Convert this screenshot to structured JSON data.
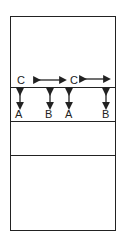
{
  "diagram": {
    "labels_top": [
      {
        "text": "C",
        "x": 17,
        "y": 75
      },
      {
        "text": "C",
        "x": 70,
        "y": 75
      }
    ],
    "labels_bottom": [
      {
        "text": "A",
        "x": 16,
        "y": 108
      },
      {
        "text": "B",
        "x": 46,
        "y": 108
      },
      {
        "text": "A",
        "x": 66,
        "y": 108
      },
      {
        "text": "B",
        "x": 102,
        "y": 108
      }
    ],
    "colors": {
      "line": "#222222",
      "background": "#ffffff"
    }
  }
}
